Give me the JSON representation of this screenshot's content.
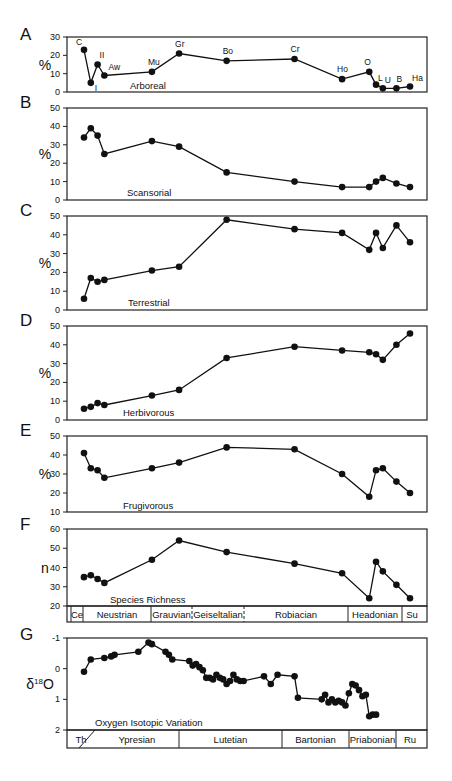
{
  "figure": {
    "panels": [
      "A",
      "B",
      "C",
      "D",
      "E",
      "F",
      "G"
    ]
  },
  "chart_data": [
    {
      "panel": "A",
      "type": "line",
      "title": "Arboreal",
      "ylabel": "%",
      "ylim": [
        0,
        30
      ],
      "yticks": [
        "0",
        "10",
        "20",
        "30"
      ],
      "point_labels": [
        "C",
        "I",
        "II",
        "Aw",
        "Mu",
        "Gr",
        "Bo",
        "Cr",
        "Ho",
        "O",
        "L",
        "U",
        "B",
        "Ha"
      ],
      "x": [
        1,
        2,
        3,
        4,
        11,
        15,
        22,
        32,
        39,
        43,
        44,
        45,
        47,
        49
      ],
      "values": [
        23,
        5,
        15,
        9,
        11,
        21,
        17,
        18,
        7,
        11,
        4,
        2,
        2,
        3
      ]
    },
    {
      "panel": "B",
      "type": "line",
      "title": "Scansorial",
      "ylabel": "%",
      "ylim": [
        0,
        50
      ],
      "yticks": [
        "0",
        "10",
        "20",
        "30",
        "40",
        "50"
      ],
      "x": [
        1,
        2,
        3,
        4,
        11,
        15,
        22,
        32,
        39,
        43,
        44,
        45,
        47,
        49
      ],
      "values": [
        34,
        39,
        35,
        25,
        32,
        29,
        15,
        10,
        7,
        7,
        10,
        12,
        9,
        7
      ]
    },
    {
      "panel": "C",
      "type": "line",
      "title": "Terrestrial",
      "ylabel": "%",
      "ylim": [
        0,
        50
      ],
      "yticks": [
        "0",
        "10",
        "20",
        "30",
        "40",
        "50"
      ],
      "x": [
        1,
        2,
        3,
        4,
        11,
        15,
        22,
        32,
        39,
        43,
        44,
        45,
        47,
        49
      ],
      "values": [
        6,
        17,
        15,
        16,
        21,
        23,
        48,
        43,
        41,
        32,
        41,
        33,
        45,
        36
      ]
    },
    {
      "panel": "D",
      "type": "line",
      "title": "Herbivorous",
      "ylabel": "%",
      "ylim": [
        0,
        50
      ],
      "yticks": [
        "0",
        "10",
        "20",
        "30",
        "40",
        "50"
      ],
      "x": [
        1,
        2,
        3,
        4,
        11,
        15,
        22,
        32,
        39,
        43,
        44,
        45,
        47,
        49
      ],
      "values": [
        6,
        7,
        9,
        8,
        13,
        16,
        33,
        39,
        37,
        36,
        35,
        32,
        40,
        46
      ]
    },
    {
      "panel": "E",
      "type": "line",
      "title": "Frugivorous",
      "ylabel": "%",
      "ylim": [
        10,
        50
      ],
      "yticks": [
        "10",
        "20",
        "30",
        "40",
        "50"
      ],
      "x": [
        1,
        2,
        3,
        4,
        11,
        15,
        22,
        32,
        39,
        43,
        44,
        45,
        47,
        49
      ],
      "values": [
        41,
        33,
        32,
        28,
        33,
        36,
        44,
        43,
        30,
        18,
        32,
        33,
        26,
        20
      ]
    },
    {
      "panel": "F",
      "type": "line",
      "title": "Species Richness",
      "ylabel": "n",
      "ylim": [
        20,
        60
      ],
      "yticks": [
        "20",
        "30",
        "40",
        "50",
        "60"
      ],
      "x": [
        1,
        2,
        3,
        4,
        11,
        15,
        22,
        32,
        39,
        43,
        44,
        45,
        47,
        49
      ],
      "values": [
        35,
        36,
        34,
        32,
        44,
        54,
        48,
        42,
        37,
        24,
        43,
        38,
        31,
        24
      ],
      "stages": [
        {
          "label": "Ce",
          "w": 12
        },
        {
          "label": "Neustrian",
          "w": 68
        },
        {
          "label": "Grauvian",
          "w": 41
        },
        {
          "label": "Geiseltalian",
          "w": 52
        },
        {
          "label": "Robiacian",
          "w": 104
        },
        {
          "label": "Headonian",
          "w": 54
        },
        {
          "label": "Su",
          "w": 20
        }
      ]
    },
    {
      "panel": "G",
      "type": "line",
      "title": "Oxygen Isotopic Variation",
      "ylabel": "δ18O",
      "ylim": [
        2,
        -1
      ],
      "yticks": [
        "-1",
        "0",
        "1",
        "2"
      ],
      "x": [
        1,
        2,
        4,
        5,
        5.5,
        9,
        10.5,
        11,
        13,
        13.5,
        14,
        16.5,
        17,
        17.5,
        18,
        18.5,
        19,
        19.5,
        20,
        20.5,
        21,
        21.5,
        22,
        22.5,
        23,
        23.5,
        24,
        24.5,
        27.5,
        28.5,
        29.5,
        32,
        32.5,
        36,
        36.5,
        37,
        37.5,
        38,
        38.5,
        39,
        39.5,
        40,
        40.5,
        41,
        41.5,
        42,
        42.5,
        43,
        43.5,
        44
      ],
      "values": [
        0.1,
        -0.3,
        -0.35,
        -0.4,
        -0.45,
        -0.55,
        -0.85,
        -0.8,
        -0.55,
        -0.45,
        -0.3,
        -0.25,
        -0.1,
        -0.15,
        -0.05,
        0.05,
        0.3,
        0.3,
        0.35,
        0.2,
        0.3,
        0.35,
        0.5,
        0.4,
        0.2,
        0.35,
        0.4,
        0.4,
        0.25,
        0.5,
        0.2,
        0.25,
        0.95,
        1.0,
        0.85,
        1.1,
        1.0,
        1.1,
        1.05,
        1.1,
        1.2,
        0.8,
        0.5,
        0.55,
        0.7,
        0.9,
        0.85,
        1.55,
        1.5,
        1.5
      ],
      "stages": [
        {
          "label": "Th",
          "w": 28
        },
        {
          "label": "Ypresian",
          "w": 84
        },
        {
          "label": "Lutetian",
          "w": 103
        },
        {
          "label": "Bartonian",
          "w": 67
        },
        {
          "label": "Priabonian",
          "w": 47
        },
        {
          "label": "Ru",
          "w": 28
        }
      ]
    }
  ]
}
